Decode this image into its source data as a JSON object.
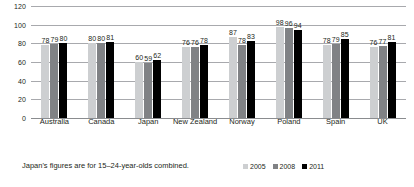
{
  "chart_data": {
    "type": "bar",
    "title": "",
    "xlabel": "",
    "ylabel": "",
    "ylim": [
      0,
      120
    ],
    "yticks": [
      0,
      20,
      40,
      60,
      80,
      100,
      120
    ],
    "grid": true,
    "legend_position": "bottom-right",
    "categories": [
      "Australia",
      "Canada",
      "Japan",
      "New Zealand",
      "Norway",
      "Poland",
      "Spain",
      "UK"
    ],
    "series": [
      {
        "name": "2005",
        "color": "#cdcfd1",
        "values": [
          78,
          80,
          60,
          76,
          87,
          98,
          78,
          76
        ]
      },
      {
        "name": "2008",
        "color": "#808285",
        "values": [
          79,
          80,
          59,
          76,
          78,
          96,
          79,
          77
        ]
      },
      {
        "name": "2011",
        "color": "#000000",
        "values": [
          80,
          81,
          62,
          78,
          83,
          94,
          85,
          81
        ]
      }
    ],
    "annotations": [
      "Japan's figures are for 15–24-year-olds combined."
    ]
  },
  "footnote": "Japan's figures are for 15–24-year-olds combined.",
  "legend": [
    {
      "label": "2005"
    },
    {
      "label": "2008"
    },
    {
      "label": "2011"
    }
  ]
}
